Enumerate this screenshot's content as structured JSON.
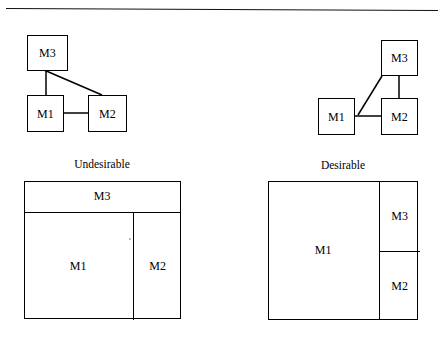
{
  "figure": {
    "divider_rule": "horizontal-rule",
    "ink_color": "#000000",
    "background_color": "#ffffff"
  },
  "graphs": {
    "left": {
      "name": "undesirable-dependency-graph",
      "nodes": [
        {
          "id": "M3",
          "label": "M3"
        },
        {
          "id": "M1",
          "label": "M1"
        },
        {
          "id": "M2",
          "label": "M2"
        }
      ],
      "edges": [
        {
          "from": "M3",
          "to": "M1"
        },
        {
          "from": "M3",
          "to": "M2"
        },
        {
          "from": "M1",
          "to": "M2"
        }
      ]
    },
    "right": {
      "name": "desirable-dependency-graph",
      "nodes": [
        {
          "id": "M3",
          "label": "M3"
        },
        {
          "id": "M1",
          "label": "M1"
        },
        {
          "id": "M2",
          "label": "M2"
        }
      ],
      "edges": [
        {
          "from": "M3",
          "to": "M1"
        },
        {
          "from": "M3",
          "to": "M2"
        },
        {
          "from": "M1",
          "to": "M2"
        }
      ]
    }
  },
  "layouts": {
    "left": {
      "caption": "Undesirable",
      "regions": [
        {
          "id": "M3",
          "label": "M3"
        },
        {
          "id": "M1",
          "label": "M1"
        },
        {
          "id": "M2",
          "label": "M2"
        }
      ]
    },
    "right": {
      "caption": "Desirable",
      "regions": [
        {
          "id": "M1",
          "label": "M1"
        },
        {
          "id": "M3",
          "label": "M3"
        },
        {
          "id": "M2",
          "label": "M2"
        }
      ]
    }
  }
}
